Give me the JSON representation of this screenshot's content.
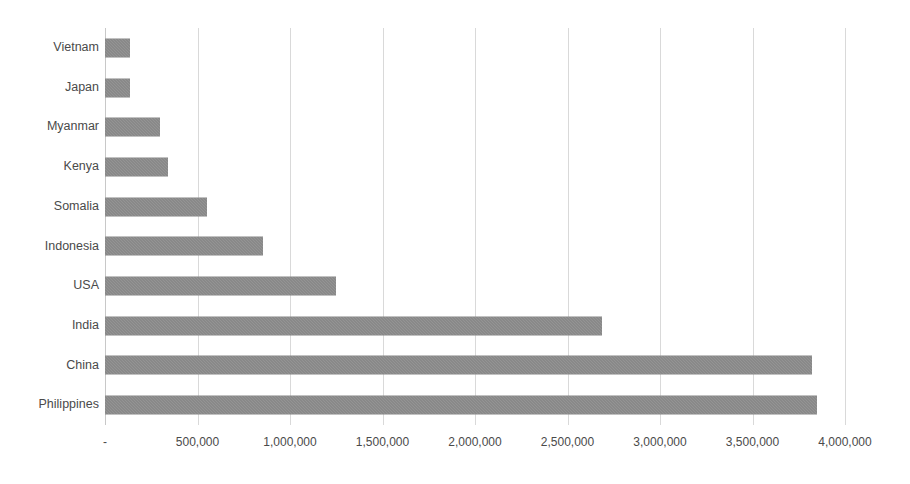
{
  "chart_data": {
    "type": "bar",
    "orientation": "horizontal",
    "title": "",
    "subtitle": "",
    "xlabel": "",
    "ylabel": "",
    "categories": [
      "Vietnam",
      "Japan",
      "Myanmar",
      "Kenya",
      "Somalia",
      "Indonesia",
      "USA",
      "India",
      "China",
      "Philippines"
    ],
    "values": [
      135000,
      135000,
      297000,
      340000,
      551000,
      854000,
      1249000,
      2687000,
      3822000,
      3849000
    ],
    "series": [
      {
        "name": "Series 1",
        "values": [
          135000,
          135000,
          297000,
          340000,
          551000,
          854000,
          1249000,
          2687000,
          3822000,
          3849000
        ]
      }
    ],
    "xlim": [
      0,
      4000000
    ],
    "xticks": [
      0,
      500000,
      1000000,
      1500000,
      2000000,
      2500000,
      3000000,
      3500000,
      4000000
    ],
    "xtick_labels": [
      "-",
      "500,000",
      "1,000,000",
      "1,500,000",
      "2,000,000",
      "2,500,000",
      "3,000,000",
      "3,500,000",
      "4,000,000"
    ],
    "grid": true,
    "grid_axis": "x",
    "legend": false,
    "legend_position": "none",
    "bar_color": "#7f7f7f",
    "gridline_color": "#d9d9d9",
    "axis_color": "#c8c8c8",
    "label_color": "#4a4a4a",
    "background": "#ffffff"
  }
}
